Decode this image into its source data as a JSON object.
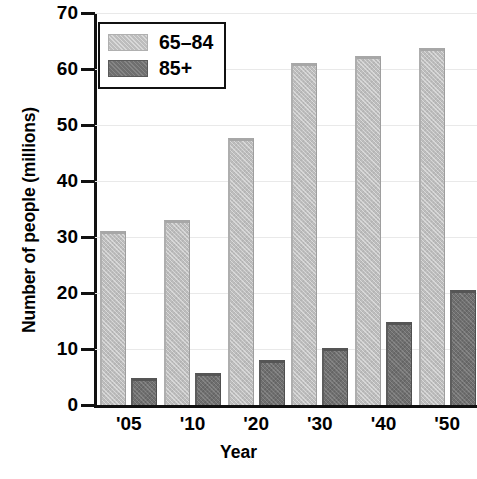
{
  "chart_data": {
    "type": "bar",
    "title": "",
    "xlabel": "Year",
    "ylabel": "Number of people (millions)",
    "categories": [
      "'05",
      "'10",
      "'20",
      "'30",
      "'40",
      "'50"
    ],
    "series": [
      {
        "name": "65–84",
        "values": [
          31.1,
          33.0,
          47.6,
          61.0,
          62.4,
          63.8
        ],
        "color": "#bdbdbd"
      },
      {
        "name": "85+",
        "values": [
          4.8,
          5.7,
          8.1,
          10.1,
          14.8,
          20.6
        ],
        "color": "#6f6f6f"
      }
    ],
    "ylim": [
      0,
      70
    ],
    "yticks": [
      0,
      10,
      20,
      30,
      40,
      50,
      60,
      70
    ],
    "ytick_labels": [
      "0",
      "10",
      "20",
      "30",
      "40",
      "50",
      "60",
      "70"
    ],
    "grid": true,
    "legend_position": "top-left"
  },
  "legend": {
    "entries": [
      {
        "label": "65–84"
      },
      {
        "label": "85+"
      }
    ]
  },
  "axes": {
    "y_title": "Number of people (millions)",
    "x_title": "Year"
  }
}
